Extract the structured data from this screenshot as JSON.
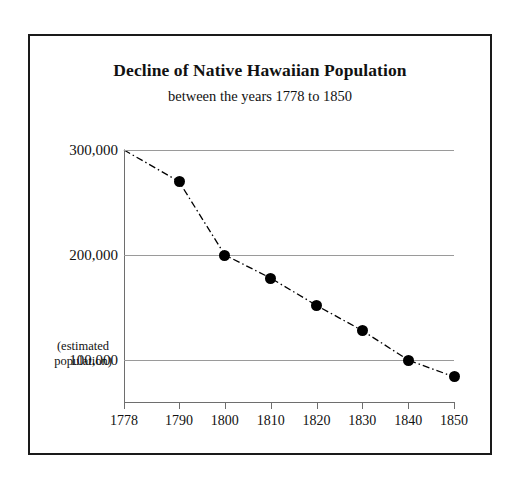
{
  "figure": {
    "title": "Decline of Native Hawaiian Population",
    "subtitle": "between the years 1778 to 1850",
    "axis_note_line1": "(estimated",
    "axis_note_line2": "population)",
    "border_color": "#1a1a1a",
    "gridline_color": "#9a9a9a",
    "marker_color": "#000000"
  },
  "chart_data": {
    "type": "line",
    "title": "Decline of Native Hawaiian Population",
    "subtitle": "between the years 1778 to 1850",
    "xlabel": "",
    "ylabel": "(estimated population)",
    "x": [
      1778,
      1790,
      1800,
      1810,
      1820,
      1830,
      1840,
      1850
    ],
    "values": [
      300000,
      270000,
      200000,
      178000,
      152000,
      128000,
      100000,
      84000
    ],
    "xticklabels": [
      "1778",
      "1790",
      "1800",
      "1810",
      "1820",
      "1830",
      "1840",
      "1850"
    ],
    "yticks": [
      100000,
      200000,
      300000
    ],
    "yticklabels": [
      "100,000",
      "200,000",
      "300,000"
    ],
    "xlim": [
      1778,
      1850
    ],
    "ylim": [
      60000,
      300000
    ],
    "grid": "horizontal",
    "legend": "none",
    "line_style": "dash-dot",
    "marker": "filled-circle",
    "markers_shown_at": [
      1790,
      1800,
      1810,
      1820,
      1830,
      1840,
      1850
    ]
  }
}
